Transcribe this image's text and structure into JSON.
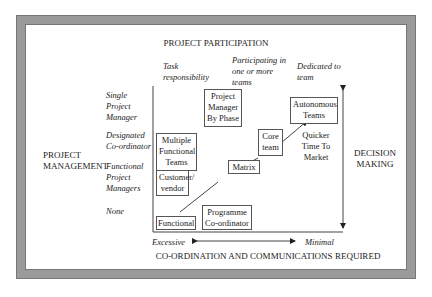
{
  "title": "PROJECT PARTICIPATION",
  "top_labels": [
    {
      "text": "Task responsibility"
    },
    {
      "text": "Participating in one or more teams"
    },
    {
      "text": "Dedicated to team"
    }
  ],
  "left_title": "PROJECT MANAGEMENT",
  "left_labels": [
    {
      "text": "Single Project Manager"
    },
    {
      "text": "Designated Co-ordinator"
    },
    {
      "text": "Functional Project Managers"
    },
    {
      "text": "None"
    }
  ],
  "right_title": "DECISION MAKING",
  "boxes": {
    "project_manager_by_phase": "Project Manager By Phase",
    "autonomous_teams": "Autonomous Teams",
    "multiple_functional_teams": "Multiple Functional Teams",
    "core_team": "Core team",
    "matrix": "Matrix",
    "customer_vendor": "Customer/ vendor",
    "functional": "Functional",
    "programme_coordinator": "Programme Co-ordinator"
  },
  "annotation": "Quicker Time To Market",
  "bottom_axis": {
    "left": "Excessive",
    "right": "Minimal",
    "title": "CO-ORDINATION AND COMMUNICATIONS REQUIRED"
  },
  "colors": {
    "frame": "#9a9a9a",
    "line": "#444444"
  }
}
